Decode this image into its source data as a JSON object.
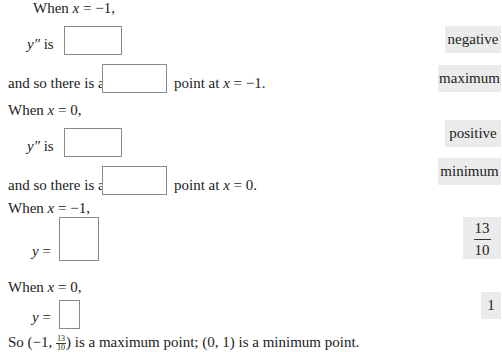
{
  "rows": {
    "r1": {
      "prefix": "When ",
      "var": "x",
      "rest": " = −1,"
    },
    "r2": {
      "var": "y″",
      "rest": " is"
    },
    "r3": {
      "prefix": "and so there is a",
      "suffix_a": "point at ",
      "var": "x",
      "suffix_b": " = −1."
    },
    "r4": {
      "prefix": "When ",
      "var": "x",
      "rest": " = 0,"
    },
    "r5": {
      "var": "y″",
      "rest": " is"
    },
    "r6": {
      "prefix": "and so there is a",
      "suffix_a": "point at ",
      "var": "x",
      "suffix_b": " = 0."
    },
    "r7": {
      "prefix": "When ",
      "var": "x",
      "rest": " = −1,"
    },
    "r8": {
      "var": "y",
      "rest": " ="
    },
    "r9": {
      "prefix": "When ",
      "var": "x",
      "rest": " = 0,"
    },
    "r10": {
      "var": "y",
      "rest": " ="
    },
    "conclusion": {
      "a": "So (−1, ",
      "frac_num": "13",
      "frac_den": "10",
      "b": ") is a maximum point; (0, 1) is a minimum point."
    }
  },
  "choices": {
    "negative": "negative",
    "maximum": "maximum",
    "positive": "positive",
    "minimum": "minimum",
    "frac_num": "13",
    "frac_den": "10",
    "one": "1"
  },
  "colors": {
    "chip_bg": "#ebebeb",
    "box_border": "#8a8a8a"
  }
}
